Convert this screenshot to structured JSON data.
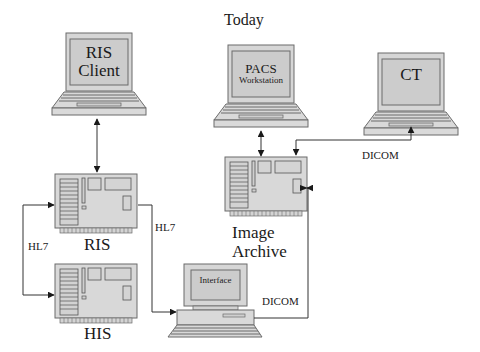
{
  "title": "Today",
  "colors": {
    "device_fill": "#d9d9d9",
    "device_stroke": "#6b6b6b",
    "screen_fill": "#cfcfcf",
    "line": "#333333",
    "background": "#ffffff"
  },
  "nodes": {
    "ris_client": {
      "type": "laptop",
      "line1": "RIS",
      "line2": "Client"
    },
    "pacs_workstation": {
      "type": "laptop",
      "line1": "PACS",
      "line2": "Workstation"
    },
    "ct": {
      "type": "laptop",
      "line1": "CT"
    },
    "ris": {
      "type": "server-board",
      "label": "RIS"
    },
    "his": {
      "type": "server-board",
      "label": "HIS"
    },
    "image_archive": {
      "type": "server-board",
      "line1": "Image",
      "line2": "Archive"
    },
    "interface": {
      "type": "desktop",
      "label": "Interface"
    }
  },
  "connections": [
    {
      "from": "RIS Client",
      "to": "RIS",
      "label": "",
      "direction": "bidirectional"
    },
    {
      "from": "RIS",
      "to": "HIS",
      "label": "HL7",
      "direction": "bidirectional"
    },
    {
      "from": "RIS",
      "to": "Interface",
      "label": "HL7",
      "direction": "to-interface"
    },
    {
      "from": "Interface",
      "to": "Image Archive",
      "label": "DICOM",
      "direction": "to-archive"
    },
    {
      "from": "PACS Workstation",
      "to": "Image Archive",
      "label": "",
      "direction": "bidirectional"
    },
    {
      "from": "CT",
      "to": "Image Archive",
      "label": "DICOM",
      "direction": "bidirectional"
    }
  ],
  "edge_labels": {
    "hl7_left": "HL7",
    "hl7_right": "HL7",
    "dicom_top": "DICOM",
    "dicom_bottom": "DICOM"
  }
}
